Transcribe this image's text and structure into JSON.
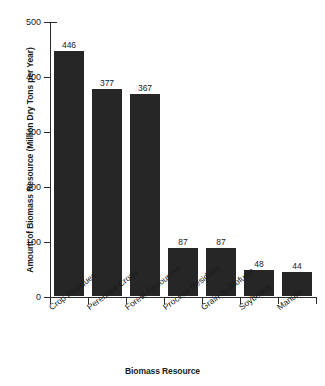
{
  "chart_data": {
    "type": "bar",
    "title": "",
    "xlabel": "Biomass Resource",
    "ylabel": "Amount of Biomass Resource (Million Dry Tons per Year)",
    "categories": [
      "Crop Residues",
      "Perennial Crops",
      "Forest Resources",
      "Process Residues",
      "Grain-to-Biofuels",
      "Soybeans",
      "Manure"
    ],
    "values": [
      446,
      377,
      367,
      87,
      87,
      48,
      44
    ],
    "value_labels": [
      "446",
      "377",
      "367",
      "87",
      "87",
      "48",
      "44"
    ],
    "ylim": [
      0,
      500
    ],
    "yticks": [
      0,
      100,
      200,
      300,
      400,
      500
    ],
    "ytick_labels": [
      "0",
      "100",
      "200",
      "300",
      "400",
      "500"
    ],
    "grid": false,
    "legend": null,
    "bar_color": "#262626",
    "axis_color": "#2b2b2b",
    "background_color": "#ffffff"
  }
}
